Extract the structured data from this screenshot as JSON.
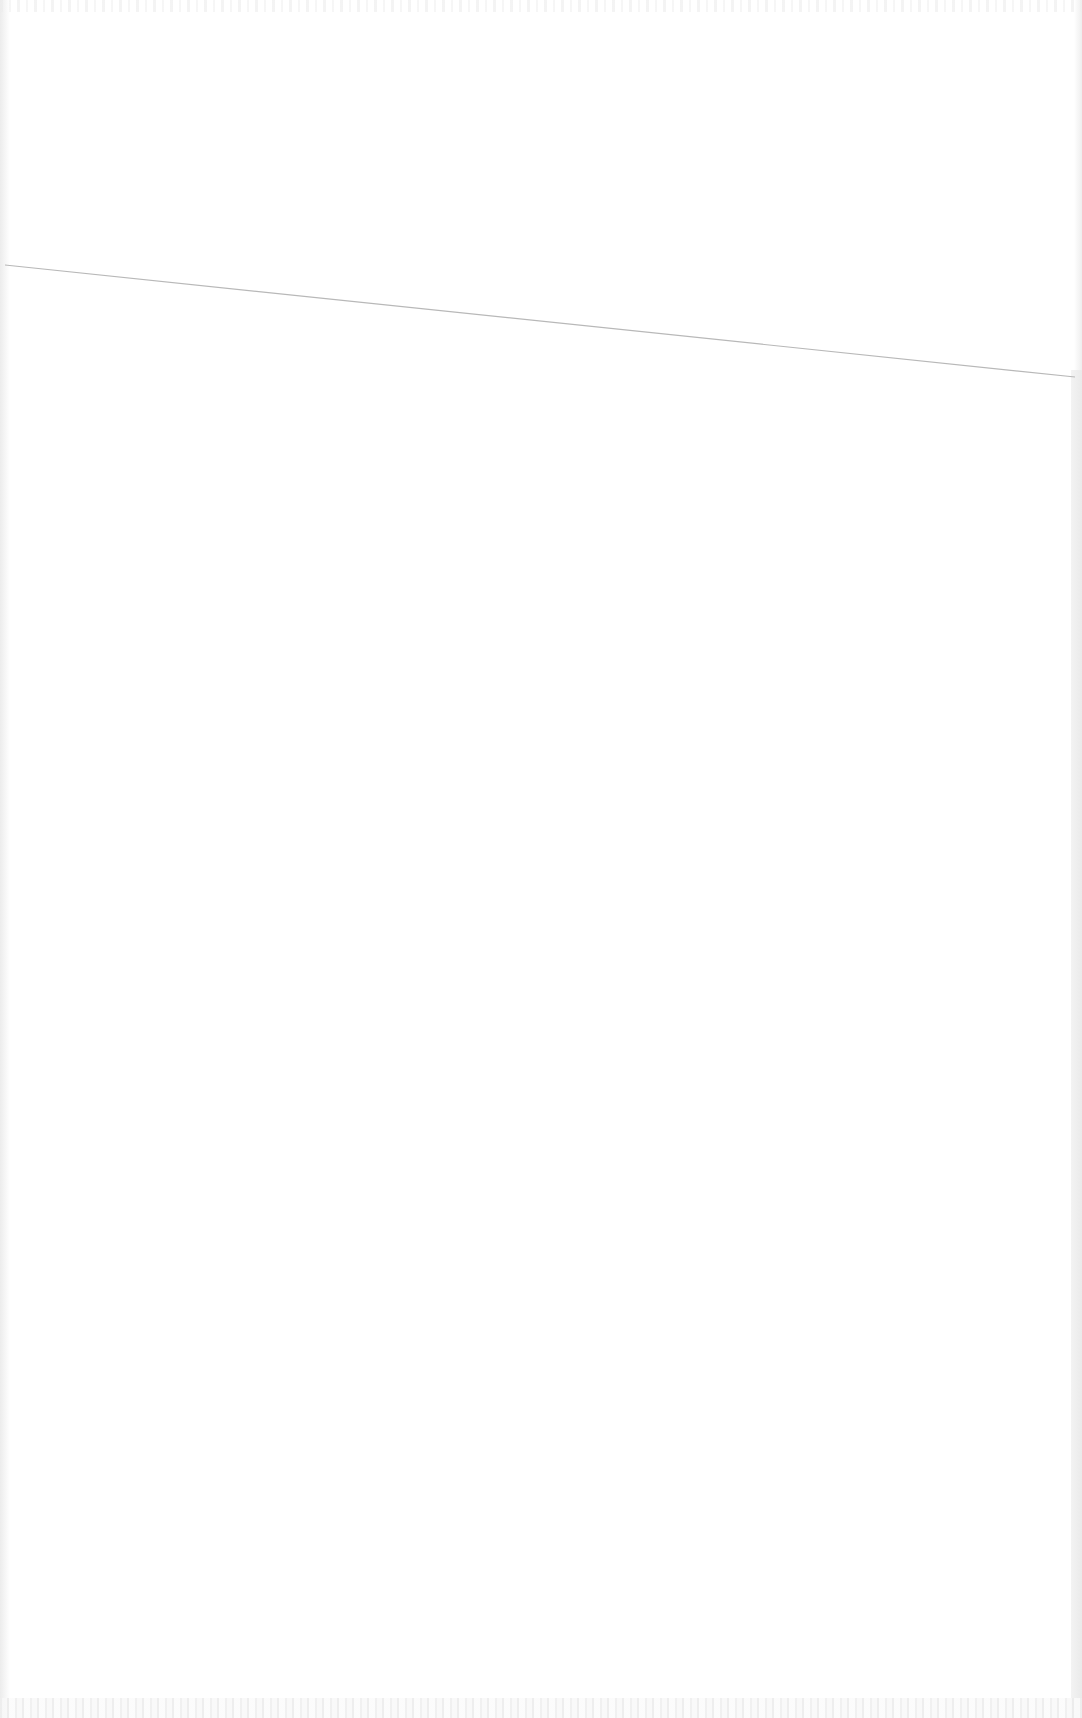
{
  "page": {
    "type": "blank scanned page",
    "background_color": "#ffffff",
    "text": ""
  },
  "rule_line": {
    "color": "#b8b8b8",
    "x1": 5,
    "y1": 265,
    "x2": 1075,
    "y2": 377
  },
  "margins": {
    "gutter_color": "#eaeaea"
  }
}
